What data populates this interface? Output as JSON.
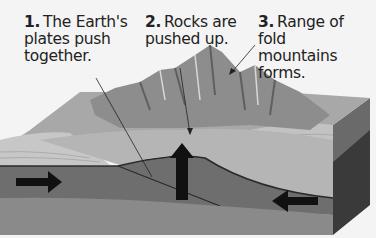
{
  "labels": [
    {
      "num": "1.",
      "text_lines": [
        "The Earth's",
        "plates push",
        "together."
      ]
    },
    {
      "num": "2.",
      "text_lines": [
        "Rocks are",
        "pushed up."
      ]
    },
    {
      "num": "3.",
      "text_lines": [
        "Range of fold",
        "mountains",
        "forms."
      ]
    }
  ],
  "colors": {
    "background": "#f4f4f4",
    "text": "#222222",
    "surface_layer": "#b9b9b9",
    "plate_layer": "#6e6e6e",
    "mantle_layer": "#8a8a8a",
    "side_face": "#3a3a3a",
    "arrow": "#111111"
  }
}
